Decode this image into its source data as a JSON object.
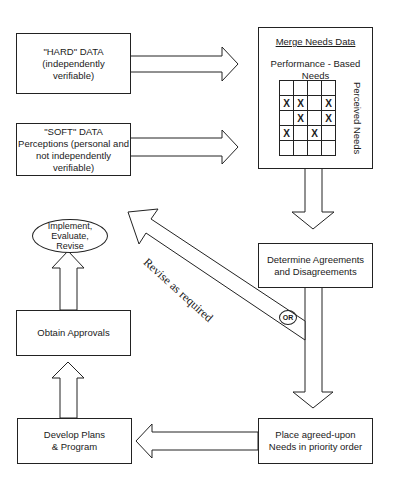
{
  "diagram": {
    "type": "flowchart",
    "nodes": {
      "hard_data": {
        "title": "\"HARD\" DATA",
        "line2": "(independently",
        "line3": "verifiable)"
      },
      "soft_data": {
        "title": "\"SOFT\" DATA",
        "line2": "Perceptions (personal and",
        "line3": "not independently",
        "line4": "verifiable)"
      },
      "merge": {
        "title": "Merge Needs Data",
        "col_label_1": "Performance - Based",
        "col_label_2": "Needs",
        "row_label": "Perceived Needs",
        "matrix": [
          [
            "",
            "",
            "",
            ""
          ],
          [
            "X",
            "X",
            "",
            "X"
          ],
          [
            "",
            "X",
            "",
            "X"
          ],
          [
            "X",
            "",
            "X",
            ""
          ],
          [
            "",
            "",
            "",
            ""
          ]
        ]
      },
      "determine": {
        "line1": "Determine Agreements",
        "line2": "and Disagreements"
      },
      "place": {
        "line1": "Place agreed-upon",
        "line2": "Needs in priority order"
      },
      "develop": {
        "line1": "Develop Plans",
        "line2": "& Program"
      },
      "approvals": {
        "line1": "Obtain Approvals"
      },
      "implement": {
        "line1": "Implement,",
        "line2": "Evaluate,",
        "line3": "Revise"
      }
    },
    "edges": {
      "revise_label": "Revise as required",
      "or_label": "OR"
    }
  }
}
